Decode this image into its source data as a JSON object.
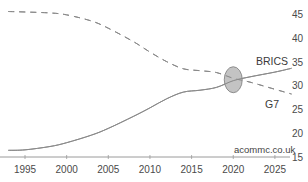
{
  "chart_data": {
    "type": "line",
    "title": "",
    "xlabel": "",
    "ylabel": "",
    "xlim": [
      1992,
      2028
    ],
    "ylim": [
      15,
      47
    ],
    "x_ticks": [
      1995,
      2000,
      2005,
      2010,
      2015,
      2020,
      2025
    ],
    "y_ticks": [
      15,
      20,
      25,
      30,
      35,
      40,
      45
    ],
    "y_axis_position": "right",
    "grid": false,
    "legend": "inline labels",
    "series": [
      {
        "name": "BRICS",
        "style": "solid",
        "color": "#8a8a8a",
        "x": [
          1993,
          1995,
          1998,
          2000,
          2003,
          2005,
          2008,
          2010,
          2012,
          2014,
          2016,
          2018,
          2020,
          2022,
          2025,
          2027
        ],
        "values": [
          16.4,
          16.5,
          17.2,
          18.0,
          19.6,
          21.0,
          23.5,
          25.3,
          27.2,
          28.6,
          29.0,
          29.6,
          31.0,
          31.8,
          32.8,
          33.6
        ]
      },
      {
        "name": "G7",
        "style": "dashed",
        "color": "#8a8a8a",
        "x": [
          1993,
          1995,
          1998,
          2000,
          2003,
          2005,
          2008,
          2010,
          2012,
          2014,
          2016,
          2018,
          2020,
          2022,
          2025,
          2027
        ],
        "values": [
          45.5,
          45.4,
          45.2,
          44.8,
          43.5,
          42.0,
          39.2,
          37.0,
          35.0,
          33.5,
          33.1,
          32.7,
          31.5,
          30.7,
          29.2,
          28.2
        ]
      }
    ],
    "annotations": [
      {
        "type": "ellipse",
        "label": "crossover",
        "x": 2020,
        "y": 31.2,
        "fill": "#bdbdbd",
        "stroke": "#777777"
      },
      {
        "type": "text",
        "text": "BRICS",
        "x": 2024,
        "y": 35
      },
      {
        "type": "text",
        "text": "G7",
        "x": 2025,
        "y": 25.5
      },
      {
        "type": "text",
        "text": "acommc.co.uk",
        "x": 2020,
        "y": 17
      }
    ]
  },
  "labels": {
    "brics": "BRICS",
    "g7": "G7",
    "credit": "acommc.co.uk"
  },
  "colors": {
    "line": "#8a8a8a",
    "axis": "#9a9a9a",
    "ellipse_fill": "#bcbcbc",
    "ellipse_stroke": "#7a7a7a"
  }
}
